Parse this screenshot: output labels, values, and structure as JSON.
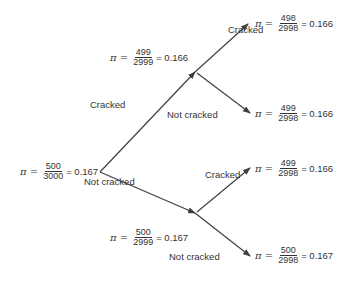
{
  "nodes": {
    "root": {
      "symbol": "π =",
      "num": "500",
      "den": "3000",
      "value": "= 0.167"
    },
    "cracked_1": {
      "symbol": "π =",
      "num": "499",
      "den": "2999",
      "value": "= 0.166"
    },
    "not_cracked_1": {
      "symbol": "π =",
      "num": "500",
      "den": "2999",
      "value": "= 0.167"
    },
    "cc": {
      "symbol": "π =",
      "num": "498",
      "den": "2998",
      "value": "= 0.166"
    },
    "cn": {
      "symbol": "π =",
      "num": "499",
      "den": "2998",
      "value": "= 0.166"
    },
    "nc": {
      "symbol": "π =",
      "num": "499",
      "den": "2998",
      "value": "= 0.166"
    },
    "nn": {
      "symbol": "π =",
      "num": "500",
      "den": "2998",
      "value": "= 0.167"
    }
  },
  "edges": {
    "root_to_c": "Cracked",
    "root_to_n": "Not cracked",
    "c_to_cc": "Cracked",
    "c_to_cn": "Not cracked",
    "n_to_nc": "Cracked",
    "n_to_nn": "Not cracked"
  },
  "colors": {
    "line": "#404040",
    "text": "#333333"
  }
}
